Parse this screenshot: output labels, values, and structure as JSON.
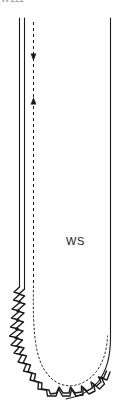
{
  "figure": {
    "caption_clipped": "W111",
    "labels": [
      {
        "id": "ws",
        "text": "WS",
        "x": 66,
        "y": 235
      }
    ],
    "colors": {
      "ink": "#1a1a1a",
      "background": "#ffffff",
      "faint_text": "#9a9a9a"
    },
    "strokes": {
      "solid_width": 1.1,
      "jagged_width": 1.4,
      "dashed_pattern": "3 3",
      "dotted_pattern": "1.6 2.6"
    },
    "geometry": {
      "left_outer_line_x": 19.5,
      "left_inner_line_x": 24.5,
      "dashed_axis_x": 33.5,
      "right_line_x": 110.5,
      "top_y": 18,
      "jagged_start_y": 286,
      "bottom_y": 404
    },
    "arrows": [
      {
        "id": "arrow-down",
        "direction": "down",
        "x": 33.5,
        "tip_y": 60
      },
      {
        "id": "arrow-up",
        "direction": "up",
        "x": 33.5,
        "tip_y": 98
      }
    ]
  }
}
